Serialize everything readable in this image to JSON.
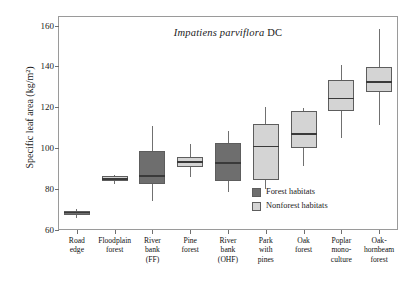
{
  "chart_data": {
    "type": "box",
    "title": "Impatiens parviflora DC",
    "title_species": "Impatiens parviflora",
    "title_authority": "DC",
    "xlabel": "",
    "ylabel": "Specific leaf area (kg/m²)",
    "ylim": [
      60,
      165
    ],
    "yticks": [
      60,
      80,
      100,
      120,
      140,
      160
    ],
    "ytick_labels": [
      "60",
      "80",
      "100",
      "120",
      "140",
      "160"
    ],
    "grid": false,
    "legend_position": "inside-bottom-right",
    "categories": [
      "Road edge",
      "Floodplain forest",
      "River bank (FF)",
      "Pine forest",
      "River bank (OHF)",
      "Park with pines",
      "Oak forest",
      "Poplar mono-culture",
      "Oak-hornbeam forest"
    ],
    "category_lines": [
      [
        "Road",
        "edge"
      ],
      [
        "Floodplain",
        "forest"
      ],
      [
        "River",
        "bank",
        "(FF)"
      ],
      [
        "Pine",
        "forest"
      ],
      [
        "River",
        "bank",
        "(OHF)"
      ],
      [
        "Park",
        "with",
        "pines"
      ],
      [
        "Oak",
        "forest"
      ],
      [
        "Poplar",
        "mono-",
        "culture"
      ],
      [
        "Oak-",
        "hornbeam",
        "forest"
      ]
    ],
    "series": [
      {
        "name": "Forest habitats",
        "color": "#6e6e6e",
        "members": [
          "Road edge",
          "River bank (FF)",
          "River bank (OHF)"
        ]
      },
      {
        "name": "Nonforest habitats",
        "color": "#d4d4d4",
        "members": [
          "Floodplain forest",
          "Pine forest",
          "Park with pines",
          "Oak forest",
          "Poplar mono-culture",
          "Oak-hornbeam forest"
        ]
      }
    ],
    "boxes": [
      {
        "category": "Road edge",
        "group": "Forest habitats",
        "min": 66.0,
        "q1": 67.5,
        "median": 68.5,
        "q3": 69.5,
        "max": 70.5
      },
      {
        "category": "Floodplain forest",
        "group": "Nonforest habitats",
        "min": 82.5,
        "q1": 84.0,
        "median": 85.0,
        "q3": 86.5,
        "max": 87.0
      },
      {
        "category": "River bank (FF)",
        "group": "Forest habitats",
        "min": 74.0,
        "q1": 82.5,
        "median": 86.5,
        "q3": 99.0,
        "max": 111.0
      },
      {
        "category": "Pine forest",
        "group": "Nonforest habitats",
        "min": 86.0,
        "q1": 91.0,
        "median": 93.5,
        "q3": 96.0,
        "max": 102.0
      },
      {
        "category": "River bank (OHF)",
        "group": "Forest habitats",
        "min": 78.5,
        "q1": 84.0,
        "median": 93.0,
        "q3": 102.5,
        "max": 108.5
      },
      {
        "category": "Park with pines",
        "group": "Nonforest habitats",
        "min": 80.0,
        "q1": 84.5,
        "median": 101.0,
        "q3": 112.0,
        "max": 120.5
      },
      {
        "category": "Oak forest",
        "group": "Nonforest habitats",
        "min": 91.5,
        "q1": 100.0,
        "median": 107.0,
        "q3": 118.5,
        "max": 120.0
      },
      {
        "category": "Poplar mono-culture",
        "group": "Nonforest habitats",
        "min": 105.0,
        "q1": 118.5,
        "median": 124.5,
        "q3": 133.5,
        "max": 141.0
      },
      {
        "category": "Oak-hornbeam forest",
        "group": "Nonforest habitats",
        "min": 111.5,
        "q1": 127.5,
        "median": 132.5,
        "q3": 140.0,
        "max": 158.5
      }
    ],
    "colors": {
      "forest": "#6e6e6e",
      "nonforest": "#d4d4d4",
      "axis": "#9a9a9a",
      "median": "#3a3a3a",
      "whisker": "#707070"
    }
  },
  "legend": {
    "items": [
      {
        "label": "Forest habitats",
        "color": "#6e6e6e"
      },
      {
        "label": "Nonforest habitats",
        "color": "#d4d4d4"
      }
    ]
  }
}
